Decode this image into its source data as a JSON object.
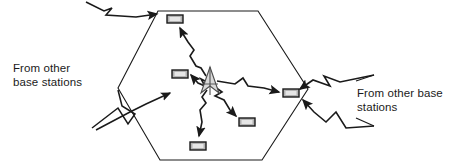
{
  "figure": {
    "type": "cellular-coverage-diagram",
    "background_color": "#ffffff",
    "stroke_color": "#1a1a1a",
    "device_fill_color": "#b3b3b3",
    "antenna_fill_color": "#d9d9d9"
  },
  "labels": {
    "left": {
      "text": "From other\nbase stations",
      "line1": "From other",
      "line2": "base stations"
    },
    "right": {
      "text": "From other base\nstations",
      "line1": "From other base",
      "line2": "stations"
    }
  },
  "cell": {
    "shape": "hexagon",
    "vertices": [
      {
        "x": 158,
        "y": 11
      },
      {
        "x": 258,
        "y": 11
      },
      {
        "x": 308,
        "y": 89
      },
      {
        "x": 262,
        "y": 160
      },
      {
        "x": 160,
        "y": 160
      },
      {
        "x": 118,
        "y": 88
      }
    ]
  },
  "base_station": {
    "name": "base-station-antenna",
    "x": 210,
    "y": 82
  },
  "mobile_units": [
    {
      "id": "mobile-top",
      "x": 167,
      "y": 15,
      "w": 16,
      "h": 8
    },
    {
      "id": "mobile-left",
      "x": 172,
      "y": 70,
      "w": 16,
      "h": 8
    },
    {
      "id": "mobile-right",
      "x": 283,
      "y": 89,
      "w": 16,
      "h": 8
    },
    {
      "id": "mobile-lower-right",
      "x": 239,
      "y": 118,
      "w": 16,
      "h": 8
    },
    {
      "id": "mobile-bottom",
      "x": 190,
      "y": 142,
      "w": 16,
      "h": 8
    }
  ],
  "signal_paths": [
    {
      "id": "path-to-mobile-top",
      "from": "base-station",
      "to": "mobile-top",
      "style": "zigzag-arrow"
    },
    {
      "id": "path-to-mobile-left",
      "from": "base-station",
      "to": "mobile-left",
      "style": "zigzag-arrow"
    },
    {
      "id": "path-to-mobile-right",
      "from": "base-station",
      "to": "mobile-right",
      "style": "zigzag-arrow"
    },
    {
      "id": "path-to-mobile-lower-right",
      "from": "base-station",
      "to": "mobile-lower-right",
      "style": "zigzag-arrow"
    },
    {
      "id": "path-to-mobile-bottom",
      "from": "base-station",
      "to": "mobile-bottom",
      "style": "zigzag-arrow"
    },
    {
      "id": "path-external-top-left",
      "from": "other-base-stations",
      "to": "mobile-top",
      "style": "zigzag-arrow"
    },
    {
      "id": "path-external-bottom-left",
      "from": "other-base-stations",
      "to": "cell-left",
      "style": "zigzag-arrow"
    },
    {
      "id": "path-external-right-upper",
      "from": "other-base-stations",
      "to": "mobile-right",
      "style": "zigzag-arrow"
    },
    {
      "id": "path-external-right-lower",
      "from": "other-base-stations",
      "to": "mobile-right",
      "style": "zigzag-arrow"
    }
  ]
}
